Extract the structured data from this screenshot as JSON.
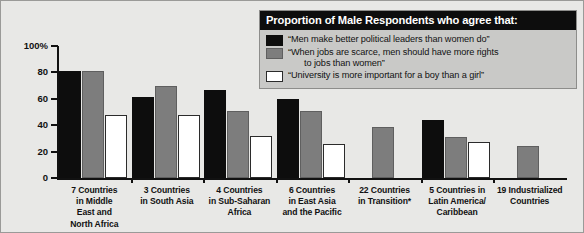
{
  "chart_data": {
    "type": "bar",
    "title": "Proportion of Male Respondents who agree that:",
    "xlabel": "",
    "ylabel": "",
    "ylim": [
      0,
      100
    ],
    "ytick_labels": [
      "100%",
      "80",
      "60",
      "40",
      "20",
      "0"
    ],
    "ytick_values": [
      100,
      80,
      60,
      40,
      20,
      0
    ],
    "grid": false,
    "legend_position": "top-right",
    "categories": [
      "7 Countries in Middle East and North Africa",
      "3 Countries in South Asia",
      "4 Countries in Sub-Saharan Africa",
      "6 Countries in East Asia and the Pacific",
      "22 Countries in Transition*",
      "5 Countries in Latin America/ Caribbean",
      "19 Industrialized Countries"
    ],
    "category_lines": [
      [
        "7 Countries",
        "in Middle",
        "East and",
        "North Africa"
      ],
      [
        "3 Countries",
        "in South Asia"
      ],
      [
        "4 Countries",
        "in Sub-Saharan",
        "Africa"
      ],
      [
        "6 Countries",
        "in East Asia",
        "and the Pacific"
      ],
      [
        "22 Countries",
        "in Transition*"
      ],
      [
        "5 Countries in",
        "Latin America/",
        "Caribbean"
      ],
      [
        "19 Industrialized",
        "Countries"
      ]
    ],
    "series": [
      {
        "name": "“Men make better political leaders than women do”",
        "color": "#0d0d0d",
        "values": [
          81,
          61,
          67,
          60,
          null,
          44,
          null
        ]
      },
      {
        "name": "“When jobs are scarce, men should have more rights to jobs than women”",
        "color": "#7d7d7d",
        "values": [
          81,
          70,
          51,
          51,
          39,
          31,
          24
        ]
      },
      {
        "name": "“University is more important for a boy than a girl”",
        "color": "#ffffff",
        "values": [
          48,
          48,
          32,
          26,
          null,
          27,
          null
        ]
      }
    ]
  },
  "legend": {
    "title": "Proportion of Male Respondents who agree that:",
    "items": [
      {
        "swatch": "s0",
        "line1": "“Men make better political leaders than women do”",
        "line2": ""
      },
      {
        "swatch": "s1",
        "line1": "“When jobs are scarce, men should have more rights",
        "line2": "to jobs than women”"
      },
      {
        "swatch": "s2",
        "line1": "“University is more important for a boy than a girl”",
        "line2": ""
      }
    ]
  }
}
